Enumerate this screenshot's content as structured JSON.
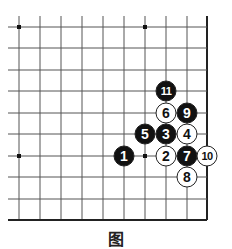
{
  "diagram": {
    "type": "go-board-corner",
    "caption": "图",
    "board": {
      "corner": "bottom-right",
      "visible_columns": 10,
      "visible_rows": 10,
      "grid_x": [
        19,
        40,
        61,
        82,
        103,
        124,
        145,
        166,
        187,
        207
      ],
      "grid_y": [
        27,
        48,
        70,
        91,
        113,
        134,
        156,
        177,
        199,
        220
      ],
      "line_color": "#555555",
      "edge_color": "#222222",
      "star_points": [
        {
          "col": 0,
          "row": 0
        },
        {
          "col": 6,
          "row": 0
        },
        {
          "col": 0,
          "row": 6
        },
        {
          "col": 6,
          "row": 6
        }
      ]
    },
    "stones": [
      {
        "move": "1",
        "color": "black",
        "col": 5,
        "row": 6
      },
      {
        "move": "2",
        "color": "white",
        "col": 7,
        "row": 6
      },
      {
        "move": "3",
        "color": "black",
        "col": 7,
        "row": 5
      },
      {
        "move": "4",
        "color": "white",
        "col": 8,
        "row": 5
      },
      {
        "move": "5",
        "color": "black",
        "col": 6,
        "row": 5
      },
      {
        "move": "6",
        "color": "white",
        "col": 7,
        "row": 4
      },
      {
        "move": "7",
        "color": "black",
        "col": 8,
        "row": 6
      },
      {
        "move": "8",
        "color": "white",
        "col": 8,
        "row": 7
      },
      {
        "move": "9",
        "color": "black",
        "col": 8,
        "row": 4
      },
      {
        "move": "10",
        "color": "white",
        "col": 9,
        "row": 6
      },
      {
        "move": "11",
        "color": "black",
        "col": 7,
        "row": 3
      }
    ],
    "colors": {
      "black_stone": "#111111",
      "white_stone": "#ffffff",
      "stone_outline": "#222222"
    }
  }
}
